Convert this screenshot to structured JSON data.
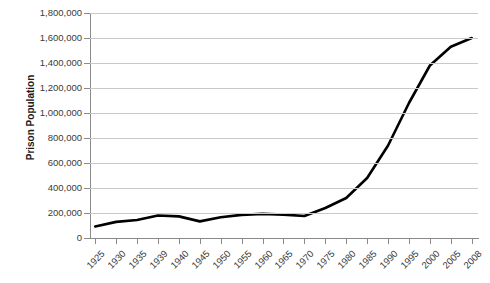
{
  "chart_data": {
    "type": "line",
    "title": "",
    "xlabel": "",
    "ylabel": "Prison Population",
    "ylim": [
      0,
      1800000
    ],
    "grid": true,
    "legend": "none",
    "line_color": "#000000",
    "gridline_color": "#c9c9c9",
    "axis_color": "#8a8a8a",
    "categories": [
      "1925",
      "1930",
      "1935",
      "1939",
      "1940",
      "1945",
      "1950",
      "1955",
      "1960",
      "1965",
      "1970",
      "1975",
      "1980",
      "1985",
      "1990",
      "1995",
      "2000",
      "2005",
      "2008"
    ],
    "values": [
      92000,
      129000,
      144000,
      180000,
      173000,
      133000,
      166000,
      185000,
      193000,
      187000,
      176000,
      240000,
      320000,
      480000,
      740000,
      1080000,
      1380000,
      1530000,
      1600000
    ],
    "y_ticks": [
      {
        "value": 0,
        "label": "0"
      },
      {
        "value": 200000,
        "label": "200,000"
      },
      {
        "value": 400000,
        "label": "400,000"
      },
      {
        "value": 600000,
        "label": "600,000"
      },
      {
        "value": 800000,
        "label": "800,000"
      },
      {
        "value": 1000000,
        "label": "1,000,000"
      },
      {
        "value": 1200000,
        "label": "1,200,000"
      },
      {
        "value": 1400000,
        "label": "1,400,000"
      },
      {
        "value": 1600000,
        "label": "1,600,000"
      },
      {
        "value": 1800000,
        "label": "1,800,000"
      }
    ]
  }
}
